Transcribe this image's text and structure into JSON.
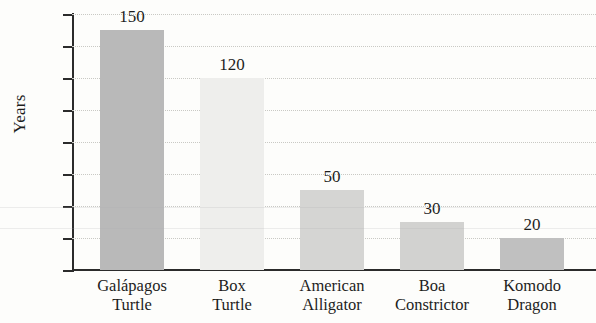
{
  "chart_data": {
    "type": "bar",
    "title": "",
    "xlabel": "",
    "ylabel": "Years",
    "ylim": [
      0,
      160
    ],
    "ytick_step": 20,
    "yticks": [
      160,
      140,
      120,
      100,
      80,
      60,
      40,
      20,
      0
    ],
    "grid": true,
    "legend": "none",
    "categories": [
      "Galápagos Turtle",
      "Box Turtle",
      "American Alligator",
      "Boa Constrictor",
      "Komodo Dragon"
    ],
    "category_lines": [
      [
        "Galápagos",
        "Turtle"
      ],
      [
        "Box",
        "Turtle"
      ],
      [
        "American",
        "Alligator"
      ],
      [
        "Boa",
        "Constrictor"
      ],
      [
        "Komodo",
        "Dragon"
      ]
    ],
    "values": [
      150,
      120,
      50,
      30,
      20
    ],
    "value_labels": [
      "150",
      "120",
      "50",
      "30",
      "20"
    ],
    "bar_colors": [
      "#b9b9b9",
      "#eeeeec",
      "#d5d5d3",
      "#d2d2d0",
      "#c0c0c0"
    ]
  },
  "axis": {
    "ylabel": "Years",
    "tick_labels": [
      "160",
      "140",
      "120",
      "100",
      "80",
      "60",
      "40",
      "20",
      "0"
    ]
  }
}
